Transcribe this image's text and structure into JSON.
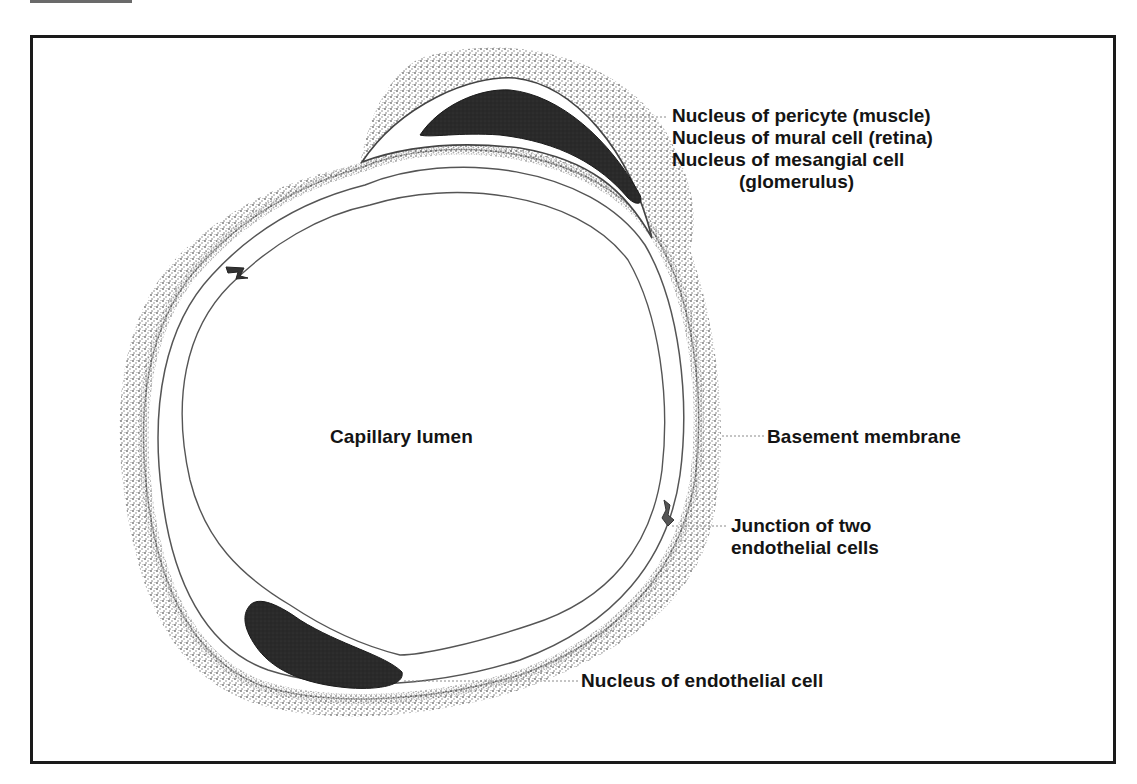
{
  "figure": {
    "colors": {
      "frame": "#1a1a1a",
      "nucleus_fill": "#2a2a2a",
      "stipple": "#7a7a7a",
      "outline": "#555555",
      "leader": "#8a8a8a",
      "text": "#141414"
    }
  },
  "labels": {
    "pericyte": {
      "lines": [
        "Nucleus of pericyte (muscle)",
        "Nucleus of mural cell (retina)",
        "Nucleus of mesangial cell",
        "(glomerulus)"
      ]
    },
    "lumen": "Capillary lumen",
    "basement_membrane": "Basement membrane",
    "junction": {
      "lines": [
        "Junction of two",
        "endothelial cells"
      ]
    },
    "endothelial_nucleus": "Nucleus of endothelial cell"
  }
}
